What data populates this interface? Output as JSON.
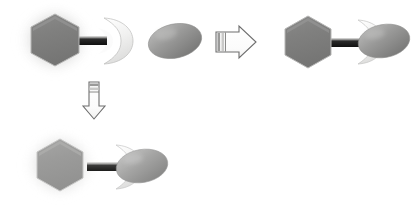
{
  "diagram": {
    "canvas": {
      "width": 414,
      "height": 206,
      "background": "#ffffff"
    },
    "palette": {
      "hexagon_fill": "#80807f",
      "hexagon_fill_faded": "#9d9d9c",
      "hexagon_stroke": "#b9b9b8",
      "linker_bar_dark": "#141414",
      "linker_bar_highlight": "#cfcfcf",
      "ellipse_fill_light": "#adadac",
      "ellipse_fill_dark": "#767675",
      "crescent_fill": "#f2f2f1",
      "crescent_stroke": "#b5b5b4",
      "arrow_fill": "#fdfdfd",
      "arrow_stroke": "#6e6e6e",
      "arrow_notch": "#8a8a8a",
      "halo_glow": "#a9a9a8"
    },
    "elements": [
      {
        "id": "free-receptor",
        "data_name": "free-receptor-group",
        "label": "Free receptor (hexagon scaffold + crescent binding pocket)",
        "position": {
          "x": 14,
          "y": 8
        },
        "parts": [
          "halo",
          "hexagon",
          "linker-bar",
          "crescent-pocket"
        ],
        "state": "unbound"
      },
      {
        "id": "free-ligand",
        "data_name": "free-ligand-ellipse",
        "label": "Free ligand (ellipse)",
        "position": {
          "x": 148,
          "y": 24
        },
        "state": "unbound"
      },
      {
        "id": "reaction-arrow-right",
        "data_name": "reaction-arrow-right",
        "label": "Binding reaction arrow (rightward)",
        "direction": "right",
        "position": {
          "x": 213,
          "y": 27
        }
      },
      {
        "id": "bound-complex-top",
        "data_name": "bound-complex-top-right",
        "label": "Receptor-ligand complex (bound)",
        "position": {
          "x": 283,
          "y": 16
        },
        "state": "bound"
      },
      {
        "id": "reaction-arrow-down",
        "data_name": "reaction-arrow-down",
        "label": "Binding reaction arrow (downward)",
        "direction": "down",
        "position": {
          "x": 85,
          "y": 80
        }
      },
      {
        "id": "bound-complex-bottom",
        "data_name": "bound-complex-bottom-left",
        "label": "Receptor-ligand complex (bound, alternate view)",
        "position": {
          "x": 20,
          "y": 133
        },
        "state": "bound"
      }
    ],
    "captions": {
      "free_receptor": "",
      "free_ligand": "",
      "bound_complex": ""
    }
  }
}
